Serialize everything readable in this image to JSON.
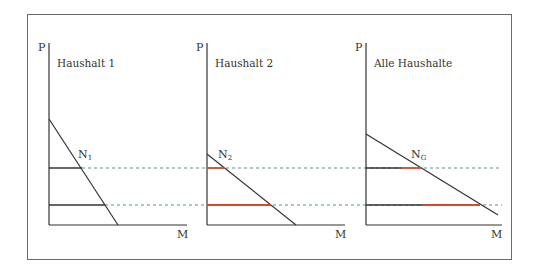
{
  "diagram": {
    "type": "demand-aggregation",
    "colors": {
      "axis": "#333333",
      "demand_line": "#333333",
      "individual_quantity": "#333333",
      "added_quantity": "#d9482b",
      "price_guide": "#5b8f8a"
    },
    "panels": [
      {
        "id": "household-1",
        "title": "Haushalt 1",
        "y_axis_label": "P",
        "x_axis_label": "M",
        "curve_label": "N",
        "curve_sub": "1"
      },
      {
        "id": "household-2",
        "title": "Haushalt 2",
        "y_axis_label": "P",
        "x_axis_label": "M",
        "curve_label": "N",
        "curve_sub": "2"
      },
      {
        "id": "all-households",
        "title": "Alle Haushalte",
        "y_axis_label": "P",
        "x_axis_label": "M",
        "curve_label": "N",
        "curve_sub": "G"
      }
    ],
    "price_levels": [
      "high",
      "low"
    ]
  }
}
